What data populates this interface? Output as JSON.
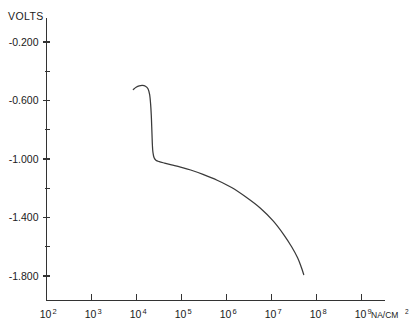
{
  "chart_data": {
    "type": "line",
    "title": "",
    "xlabel": "10⁹NA/CM²",
    "ylabel": "VOLTS",
    "xscale": "log",
    "xlim": [
      100,
      1000000000
    ],
    "ylim": [
      -2.0,
      0.0
    ],
    "grid": false,
    "legend": null,
    "y_axis": {
      "label": "VOLTS",
      "major_ticks": [
        -0.2,
        -0.6,
        -1.0,
        -1.4,
        -1.8
      ],
      "major_tick_labels": [
        "-0.200",
        "-0.600",
        "-1.000",
        "-1.400",
        "-1.800"
      ],
      "minor_ticks": [
        0.0,
        -0.4,
        -0.8,
        -1.2,
        -1.6,
        -2.0
      ]
    },
    "x_axis": {
      "unit_label": "NA/CM²",
      "major_tick_mantissa": "10",
      "major_ticks": [
        100,
        1000,
        10000,
        100000,
        1000000,
        10000000,
        100000000,
        1000000000
      ],
      "major_tick_exponents": [
        "2",
        "3",
        "4",
        "5",
        "6",
        "7",
        "8",
        "9"
      ],
      "major_tick_labels": [
        "10²",
        "10³",
        "10⁴",
        "10⁵",
        "10⁶",
        "10⁷",
        "10⁸",
        "10⁹"
      ]
    },
    "series": [
      {
        "name": "polarization curve",
        "color": "#3a3a3a",
        "x": [
          8500,
          9800,
          11500,
          13500,
          15800,
          18000,
          19600,
          20600,
          21300,
          21800,
          22200,
          22600,
          23200,
          24500,
          27000,
          32000,
          42000,
          60000,
          95000,
          160000,
          300000,
          620000,
          1300000,
          2700000,
          5600000,
          11000000,
          19000000,
          28000000,
          38000000,
          46000000,
          52000000
        ],
        "y": [
          -0.525,
          -0.51,
          -0.5,
          -0.497,
          -0.502,
          -0.52,
          -0.56,
          -0.625,
          -0.7,
          -0.78,
          -0.85,
          -0.91,
          -0.955,
          -0.99,
          -1.008,
          -1.018,
          -1.028,
          -1.04,
          -1.055,
          -1.075,
          -1.105,
          -1.145,
          -1.195,
          -1.26,
          -1.335,
          -1.425,
          -1.52,
          -1.6,
          -1.675,
          -1.74,
          -1.79
        ]
      }
    ]
  }
}
